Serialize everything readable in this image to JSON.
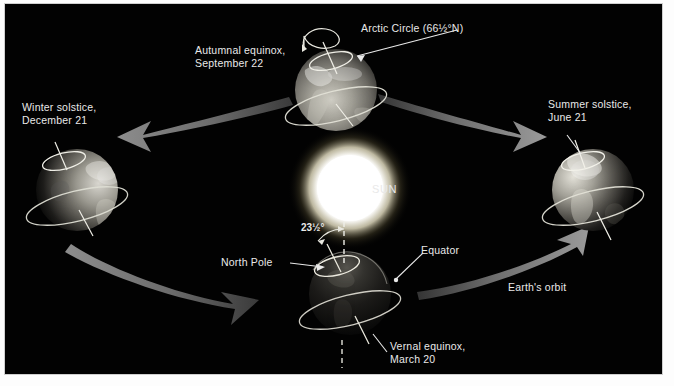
{
  "figure": {
    "background_color": "#020202",
    "frame_color": "#ffffff",
    "text_color": "#e9e9e9"
  },
  "sun": {
    "label": "SUN",
    "core_color": "#ffffff",
    "glow_color": "#fdf6d8",
    "center": [
      345,
      184
    ],
    "radius": 34
  },
  "labels": {
    "arctic_circle": "Arctic Circle (66½°N)",
    "autumnal_equinox": "Autumnal equinox,\nSeptember 22",
    "winter_solstice": "Winter solstice,\nDecember 21",
    "summer_solstice": "Summer solstice,\nJune 21",
    "vernal_equinox": "Vernal equinox,\nMarch 20",
    "north_pole": "North Pole",
    "equator": "Equator",
    "axial_tilt": "23½°",
    "earths_orbit": "Earth's orbit"
  },
  "globes": [
    {
      "id": "autumnal-equinox-globe",
      "season": "Autumnal equinox",
      "date": "September 22",
      "position": "top",
      "center": [
        331,
        86
      ],
      "radius": 41,
      "lit_side": "front",
      "shows": [
        "arctic-circle-ring",
        "rotation-arrow",
        "equator-ring",
        "axis-line"
      ]
    },
    {
      "id": "winter-solstice-globe",
      "season": "Winter solstice",
      "date": "December 21",
      "position": "left",
      "center": [
        72,
        186
      ],
      "radius": 41,
      "lit_side": "right",
      "shows": [
        "arctic-circle-ring",
        "equator-ring",
        "axis-line"
      ]
    },
    {
      "id": "summer-solstice-globe",
      "season": "Summer solstice",
      "date": "June 21",
      "position": "right",
      "center": [
        588,
        186
      ],
      "radius": 41,
      "lit_side": "left",
      "shows": [
        "arctic-circle-ring",
        "equator-ring",
        "axis-line"
      ]
    },
    {
      "id": "vernal-equinox-globe",
      "season": "Vernal equinox",
      "date": "March 20",
      "position": "bottom",
      "center": [
        345,
        290
      ],
      "radius": 41,
      "lit_side": "back",
      "shows": [
        "arctic-circle-ring",
        "equator-ring",
        "axis-line",
        "dashed-vertical-reference",
        "tilt-angle-arc"
      ]
    }
  ],
  "orbit_arrows": [
    {
      "id": "arrow-top-left",
      "direction": "counterclockwise",
      "from": "autumnal-equinox-globe",
      "to": "winter-solstice-globe"
    },
    {
      "id": "arrow-bottom-left",
      "direction": "counterclockwise",
      "from": "winter-solstice-globe",
      "to": "vernal-equinox-globe"
    },
    {
      "id": "arrow-bottom-right",
      "direction": "counterclockwise",
      "from": "vernal-equinox-globe",
      "to": "summer-solstice-globe"
    },
    {
      "id": "arrow-top-right",
      "direction": "counterclockwise",
      "from": "summer-solstice-globe",
      "to": "autumnal-equinox-globe"
    }
  ]
}
